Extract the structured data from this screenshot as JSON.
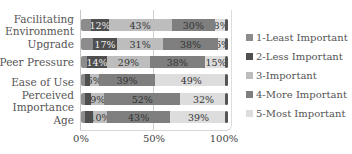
{
  "chart_data": {
    "type": "bar",
    "orientation": "horizontal",
    "stacked": true,
    "percent": true,
    "title": "",
    "xlabel": "",
    "ylabel": "",
    "xlim": [
      0,
      100
    ],
    "x_ticks": [
      "0%",
      "50%",
      "100%"
    ],
    "grid": true,
    "legend_position": "right",
    "categories": [
      "Facilitating Environment",
      "Upgrade",
      "Peer Pressure",
      "Ease of Use",
      "Perceived Importance",
      "Age"
    ],
    "category_lines": [
      [
        "Facilitating",
        "Environment"
      ],
      [
        "Upgrade"
      ],
      [
        "Peer Pressure"
      ],
      [
        "Ease of Use"
      ],
      [
        "Perceived",
        "Importance"
      ],
      [
        "Age"
      ]
    ],
    "series": [
      {
        "name": "1-Least Important",
        "color": "#8c8c8c",
        "values": [
          7,
          8,
          4,
          3,
          3,
          3
        ],
        "labels": [
          "",
          "",
          "",
          "",
          "",
          ""
        ]
      },
      {
        "name": "2-Less Important",
        "color": "#4f4f4f",
        "values": [
          12,
          17,
          14,
          3,
          4,
          5
        ],
        "labels": [
          "12%",
          "17%",
          "14%",
          "",
          "",
          ""
        ]
      },
      {
        "name": "3-Important",
        "color": "#bdbdbd",
        "values": [
          43,
          31,
          29,
          6,
          9,
          10
        ],
        "labels": [
          "43%",
          "31%",
          "29%",
          "6%",
          "9%",
          "10%"
        ]
      },
      {
        "name": "4-More Important",
        "color": "#7f7f7f",
        "values": [
          30,
          38,
          38,
          39,
          52,
          43
        ],
        "labels": [
          "30%",
          "38%",
          "38%",
          "39%",
          "52%",
          "43%"
        ]
      },
      {
        "name": "5-Most Important",
        "color": "#dddddd",
        "values": [
          8,
          6,
          15,
          49,
          32,
          39
        ],
        "labels": [
          "8%",
          "6%",
          "15%",
          "49%",
          "32%",
          "39%"
        ]
      }
    ]
  },
  "legend": {
    "items": [
      "1-Least Important",
      "2-Less Important",
      "3-Important",
      "4-More Important",
      "5-Most Important"
    ]
  },
  "axis": {
    "ticks": [
      "0%",
      "50%",
      "100%"
    ]
  }
}
